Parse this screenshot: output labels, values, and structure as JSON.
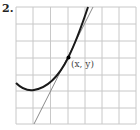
{
  "problem_number": "2.",
  "point_label": "(x, y)",
  "colors": {
    "grid": "#c8c8c8",
    "curve": "#1a1a1a",
    "tangent": "#8a8a8a",
    "point": "#000000"
  },
  "diagram": {
    "type": "graph-with-tangent",
    "grid": {
      "columns": 7,
      "rows": 7
    },
    "curve": "parabola-like, minimum near lower-left, rising steeply to top",
    "tangent_line": "line tangent to curve at labeled point",
    "point": "(x, y)"
  }
}
